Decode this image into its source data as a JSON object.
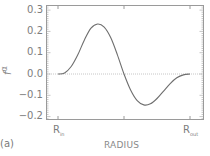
{
  "panel_label": "(a)",
  "chart_data": {
    "type": "line",
    "title": "",
    "xlabel": "RADIUS",
    "ylabel": "f^α",
    "ylabel_base": "f",
    "ylabel_sup": "α",
    "x_tick_labels": [
      {
        "base": "R",
        "sub": "in"
      },
      {
        "base": "R",
        "sub": "out"
      }
    ],
    "y_ticks": [
      "0.3",
      "0.2",
      "0.1",
      "0.0",
      "−0.1",
      "−0.2"
    ],
    "ylim": [
      -0.215,
      0.325
    ],
    "grid": false,
    "reference_line": {
      "y": 0.0,
      "style": "dotted"
    },
    "series": [
      {
        "name": "f^α",
        "x": [
          0.0,
          0.05,
          0.1,
          0.15,
          0.2,
          0.25,
          0.3,
          0.35,
          0.4,
          0.45,
          0.5,
          0.55,
          0.6,
          0.65,
          0.7,
          0.75,
          0.8,
          0.85,
          0.9,
          0.95,
          1.0
        ],
        "values": [
          0.0,
          0.005,
          0.035,
          0.09,
          0.16,
          0.215,
          0.235,
          0.22,
          0.17,
          0.09,
          0.0,
          -0.075,
          -0.125,
          -0.145,
          -0.14,
          -0.115,
          -0.08,
          -0.045,
          -0.018,
          -0.004,
          0.0
        ]
      }
    ]
  }
}
